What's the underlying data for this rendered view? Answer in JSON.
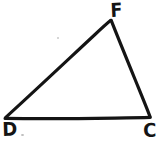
{
  "figure": {
    "kind": "hand-drawn-triangle-diagram",
    "background_color": "#ffffff",
    "stroke_color": "#141414",
    "canvas": {
      "width": 165,
      "height": 145
    },
    "labels": {
      "apex": "F",
      "bottom_left": "D",
      "bottom_right": "C"
    },
    "vertices": [
      {
        "name": "F",
        "x": 111,
        "y": 20
      },
      {
        "name": "D",
        "x": 5,
        "y": 118
      },
      {
        "name": "C",
        "x": 150,
        "y": 118
      }
    ],
    "edges": [
      {
        "name": "edge-DF",
        "from": "D",
        "to": "F"
      },
      {
        "name": "edge-FC",
        "from": "F",
        "to": "C"
      },
      {
        "name": "edge-DC",
        "from": "D",
        "to": "C"
      }
    ],
    "artifacts": [
      {
        "name": "speck-upper",
        "x": 57,
        "y": 37
      },
      {
        "name": "speck-lower",
        "x": 21,
        "y": 134
      }
    ]
  }
}
